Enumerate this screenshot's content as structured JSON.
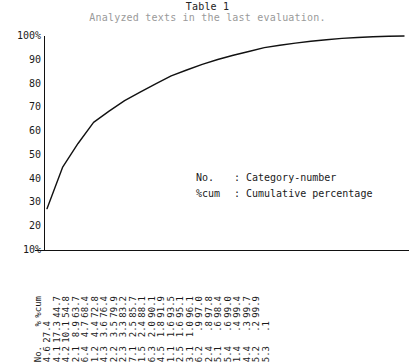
{
  "caption": {
    "title": "Table 1",
    "subtitle": "Analyzed texts in the last evaluation."
  },
  "legend": {
    "rows": [
      {
        "key": "No.",
        "sep": ":",
        "desc": "Category-number"
      },
      {
        "key": "%cum",
        "sep": ":",
        "desc": "Cumulative percentage"
      }
    ]
  },
  "axis": {
    "y_ticks": [
      "100%",
      "90",
      "80",
      "70",
      "60",
      "50",
      "40",
      "30",
      "20",
      "10%"
    ]
  },
  "table": {
    "row_headers": [
      "No.",
      "%",
      "%cum"
    ],
    "columns": [
      {
        "no": "4.6",
        "pct": "27.4",
        "cum": ""
      },
      {
        "no": "4.1",
        "pct": "17.3",
        "cum": "44.7"
      },
      {
        "no": "4.2",
        "pct": "10.1",
        "cum": "54.8"
      },
      {
        "no": "2.1",
        "pct": "8.9",
        "cum": "63.7"
      },
      {
        "no": "6.4",
        "pct": "4.7",
        "cum": "68.4"
      },
      {
        "no": "1.2",
        "pct": "4.4",
        "cum": "72.8"
      },
      {
        "no": "4.3",
        "pct": "3.6",
        "cum": "76.4"
      },
      {
        "no": "2.2",
        "pct": "3.5",
        "cum": "79.9"
      },
      {
        "no": "2.3",
        "pct": "3.3",
        "cum": "83.2"
      },
      {
        "no": "7.1",
        "pct": "2.5",
        "cum": "85.7"
      },
      {
        "no": "1.5",
        "pct": "2.4",
        "cum": "88.1"
      },
      {
        "no": "6.3",
        "pct": "2.0",
        "cum": "90.1"
      },
      {
        "no": "4.5",
        "pct": "1.8",
        "cum": "91.9"
      },
      {
        "no": "1.1",
        "pct": "1.6",
        "cum": "93.5"
      },
      {
        "no": "2.5",
        "pct": "1.6",
        "cum": "95.1"
      },
      {
        "no": "3.1",
        "pct": "1.0",
        "cum": "96.1"
      },
      {
        "no": "6.2",
        "pct": ".9",
        "cum": "97.0"
      },
      {
        "no": "2.4",
        "pct": ".8",
        "cum": "97.8"
      },
      {
        "no": "5.1",
        "pct": ".6",
        "cum": "98.4"
      },
      {
        "no": "5.4",
        "pct": ".6",
        "cum": "99.0"
      },
      {
        "no": "1.4",
        "pct": ".4",
        "cum": "99.4"
      },
      {
        "no": "4.4",
        "pct": ".3",
        "cum": "99.7"
      },
      {
        "no": "5.2",
        "pct": ".2",
        "cum": "99.9"
      },
      {
        "no": "5.3",
        "pct": ".1",
        "cum": ""
      }
    ]
  },
  "chart_data": {
    "type": "line",
    "title": "Table 1",
    "subtitle": "Analyzed texts in the last evaluation.",
    "xlabel": "",
    "ylabel": "%cum",
    "ylim": [
      10,
      100
    ],
    "grid": false,
    "legend_position": "inside-center",
    "categories": [
      "4.6",
      "4.1",
      "4.2",
      "2.1",
      "6.4",
      "1.2",
      "4.3",
      "2.2",
      "2.3",
      "7.1",
      "1.5",
      "6.3",
      "4.5",
      "1.1",
      "2.5",
      "3.1",
      "6.2",
      "2.4",
      "5.1",
      "5.4",
      "1.4",
      "4.4",
      "5.2",
      "5.3"
    ],
    "series": [
      {
        "name": "%cum",
        "values": [
          27.4,
          44.7,
          54.8,
          63.7,
          68.4,
          72.8,
          76.4,
          79.9,
          83.2,
          85.7,
          88.1,
          90.1,
          91.9,
          93.5,
          95.1,
          96.1,
          97.0,
          97.8,
          98.4,
          99.0,
          99.4,
          99.7,
          99.9,
          100.0
        ]
      },
      {
        "name": "%",
        "values": [
          27.4,
          17.3,
          10.1,
          8.9,
          4.7,
          4.4,
          3.6,
          3.5,
          3.3,
          2.5,
          2.4,
          2.0,
          1.8,
          1.6,
          1.6,
          1.0,
          0.9,
          0.8,
          0.6,
          0.6,
          0.4,
          0.3,
          0.2,
          0.1
        ]
      }
    ],
    "annotations": [
      "No.  : Category-number",
      "%cum : Cumulative percentage"
    ]
  }
}
